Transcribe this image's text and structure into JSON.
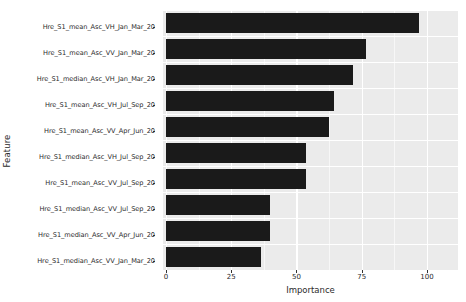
{
  "chart_data": {
    "type": "bar",
    "orientation": "horizontal",
    "title": "",
    "xlabel": "Importance",
    "ylabel": "Feature",
    "xlim": [
      0,
      105
    ],
    "ylim": null,
    "grid": true,
    "legend": null,
    "x_ticks": [
      0,
      25,
      50,
      75,
      100
    ],
    "x_tick_labels": [
      "0",
      "25",
      "50",
      "75",
      "100"
    ],
    "categories": [
      "Hre_S1_mean_Asc_VH_Jan_Mar_20",
      "Hre_S1_mean_Asc_VV_Jan_Mar_20",
      "Hre_S1_median_Asc_VH_Jan_Mar_20",
      "Hre_S1_mean_Asc_VH_Jul_Sep_20",
      "Hre_S1_mean_Asc_VV_Apr_Jun_20",
      "Hre_S1_median_Asc_VH_Jul_Sep_20",
      "Hre_S1_mean_Asc_VV_Jul_Sep_20",
      "Hre_S1_median_Asc_VV_Jul_Sep_20",
      "Hre_S1_median_Asc_VV_Apr_Jun_20",
      "Hre_S1_median_Asc_VV_Jan_Mar_20"
    ],
    "values": [
      97,
      76.5,
      71.5,
      64.5,
      62.5,
      53.5,
      53.5,
      40,
      40,
      36.5
    ],
    "bar_color": "#1a1a1a",
    "panel_color": "#ebebeb",
    "gridline_color": "#ffffff"
  }
}
